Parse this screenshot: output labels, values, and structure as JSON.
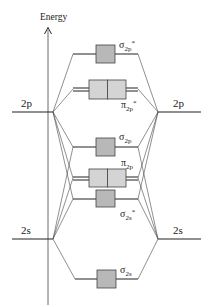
{
  "axis": {
    "label": "Energy"
  },
  "atomic_orbitals": {
    "left_2p": "2p",
    "right_2p": "2p",
    "left_2s": "2s",
    "right_2s": "2s"
  },
  "molecular_orbitals": {
    "sigma_2p_star": {
      "symbol": "σ",
      "sub": "2p",
      "sup": "*"
    },
    "pi_2p_star": {
      "symbol": "π",
      "sub": "2p",
      "sup": "*"
    },
    "sigma_2p": {
      "symbol": "σ",
      "sub": "2p",
      "sup": ""
    },
    "pi_2p": {
      "symbol": "π",
      "sub": "2p",
      "sup": ""
    },
    "sigma_2s_star": {
      "symbol": "σ",
      "sub": "2s",
      "sup": "*"
    },
    "sigma_2s": {
      "symbol": "σ",
      "sub": "2s",
      "sup": ""
    }
  },
  "colors": {
    "line": "#333333",
    "box_fill_dark": "#b8b8b8",
    "box_fill_light": "#d4d4d4",
    "box_stroke": "#444444"
  }
}
